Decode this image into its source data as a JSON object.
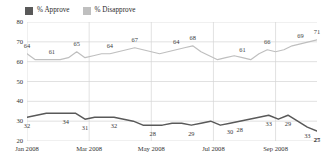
{
  "legend": {
    "position": "top-left",
    "entries": [
      {
        "label": "% Approve",
        "color": "#595959",
        "swatch_name": "approve-swatch"
      },
      {
        "label": "% Disapprove",
        "color": "#bfbfbf",
        "swatch_name": "disapprove-swatch"
      }
    ]
  },
  "chart_data": {
    "type": "line",
    "title": "",
    "subtitle": "",
    "xlabel": "",
    "ylabel": "",
    "ylim": [
      20,
      80
    ],
    "yticks": [
      80,
      70,
      60,
      50,
      40,
      30,
      20
    ],
    "xticks": [
      "Jan 2008",
      "Mar 2008",
      "May 2008",
      "Jul 2008",
      "Sep 2008"
    ],
    "xtick_index": [
      0,
      6,
      12,
      18,
      24
    ],
    "grid": "horizontal-and-vertical",
    "legend_position": "top-left",
    "n_points": 29,
    "series": [
      {
        "name": "% Approve",
        "color": "#595959",
        "values": [
          32,
          33,
          34,
          34,
          34,
          34,
          31,
          32,
          32,
          32,
          31,
          30,
          28,
          28,
          28,
          29,
          29,
          28,
          29,
          30,
          28,
          29,
          30,
          31,
          32,
          33,
          31,
          33,
          30,
          27,
          25
        ],
        "labels": [
          {
            "index": 0,
            "value": 32
          },
          {
            "index": 4,
            "value": 34
          },
          {
            "index": 6,
            "value": 31
          },
          {
            "index": 9,
            "value": 32
          },
          {
            "index": 13,
            "value": 28
          },
          {
            "index": 17,
            "value": 29
          },
          {
            "index": 21,
            "value": 30
          },
          {
            "index": 22,
            "value": 28
          },
          {
            "index": 25,
            "value": 33
          },
          {
            "index": 27,
            "value": 29
          },
          {
            "index": 29,
            "value": 33
          },
          {
            "index": 31,
            "value": 27
          },
          {
            "index": 33,
            "value": 25
          }
        ]
      },
      {
        "name": "% Disapprove",
        "color": "#bfbfbf",
        "values": [
          64,
          61,
          61,
          61,
          61,
          62,
          65,
          62,
          63,
          64,
          64,
          65,
          66,
          67,
          66,
          65,
          64,
          65,
          66,
          67,
          68,
          65,
          63,
          61,
          62,
          63,
          62,
          61,
          64,
          66,
          65,
          66,
          68,
          69,
          70,
          71
        ],
        "labels": [
          {
            "index": 0,
            "value": 64
          },
          {
            "index": 3,
            "value": 61
          },
          {
            "index": 6,
            "value": 65
          },
          {
            "index": 10,
            "value": 64
          },
          {
            "index": 13,
            "value": 67
          },
          {
            "index": 18,
            "value": 64
          },
          {
            "index": 20,
            "value": 68
          },
          {
            "index": 26,
            "value": 61
          },
          {
            "index": 29,
            "value": 66
          },
          {
            "index": 33,
            "value": 69
          },
          {
            "index": 35,
            "value": 71
          }
        ]
      }
    ]
  }
}
